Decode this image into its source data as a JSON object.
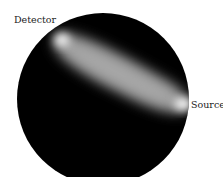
{
  "figure": {
    "labels": {
      "detector": "Detector",
      "source": "Source"
    },
    "colors": {
      "background": "#ffffff",
      "disk": "#000000",
      "beam_peak": "#f2f2f2",
      "beam_mid": "#9a9a9a",
      "label_text": "#222222"
    }
  }
}
